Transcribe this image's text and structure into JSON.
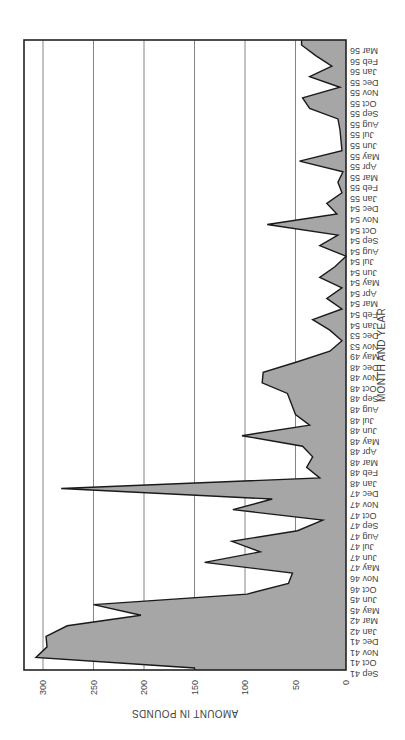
{
  "chart_data": {
    "type": "area",
    "orientation": "rotated 90 degrees clockwise (x-axis runs vertically on the right, y-axis horizontally at the bottom, text upside-down)",
    "title": "",
    "xlabel": "MONTH AND YEAR",
    "ylabel": "AMOUNT IN POUNDS",
    "ylim": [
      0,
      320
    ],
    "yticks": [
      0,
      50,
      100,
      150,
      200,
      250,
      300
    ],
    "grid": true,
    "legend": null,
    "fill_color": "#a6a6a6",
    "line_color": "#1a1a1a",
    "categories": [
      "Sep 41",
      "Oct 41",
      "Nov 41",
      "Dec 41",
      "Jan 42",
      "Mar 42",
      "May 45",
      "Jun 45",
      "Oct 46",
      "Nov 46",
      "May 47",
      "Jun 47",
      "Jul 47",
      "Aug 47",
      "Sep 47",
      "Oct 47",
      "Nov 47",
      "Dec 47",
      "Jan 48",
      "Feb 48",
      "Mar 48",
      "Apr 48",
      "May 48",
      "Jun 48",
      "Jul 48",
      "Aug 48",
      "Sep 48",
      "Oct 48",
      "Nov 48",
      "Dec 48",
      "May 49",
      "Nov 53",
      "Dec 53",
      "Jan 54",
      "Feb 54",
      "Mar 54",
      "Apr 54",
      "May 54",
      "Jun 54",
      "Jul 54",
      "Aug 54",
      "Sep 54",
      "Oct 54",
      "Nov 54",
      "Dec 54",
      "Jan 55",
      "Feb 55",
      "Mar 55",
      "Apr 55",
      "May 55",
      "Jun 55",
      "Jul 55",
      "Aug 55",
      "Sep 55",
      "Oct 55",
      "Nov 55",
      "Dec 55",
      "Jan 56",
      "Feb 56",
      "Mar 56"
    ],
    "values": [
      150,
      307,
      296,
      297,
      276,
      203,
      250,
      98,
      57,
      53,
      140,
      85,
      113,
      48,
      23,
      112,
      73,
      282,
      26,
      39,
      33,
      43,
      103,
      36,
      50,
      54,
      58,
      83,
      82,
      48,
      16,
      4,
      16,
      33,
      4,
      19,
      4,
      26,
      11,
      0,
      26,
      8,
      78,
      9,
      19,
      4,
      8,
      3,
      46,
      4,
      5,
      6,
      8,
      36,
      43,
      6,
      36,
      14,
      30,
      44
    ]
  }
}
